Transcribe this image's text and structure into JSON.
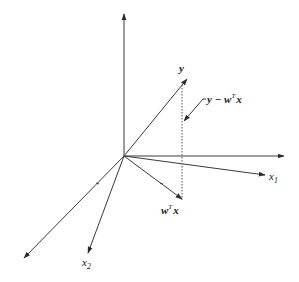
{
  "diagram": {
    "labels": {
      "y": "y",
      "residual_main": "y − w",
      "residual_sup": "T",
      "residual_tail": "x",
      "proj_main": "w",
      "proj_sup": "T",
      "proj_tail": "x",
      "x1_main": "x",
      "x1_sub": "1",
      "x2_main": "x",
      "x2_sub": "2"
    },
    "elements": [
      {
        "id": "vertical-axis",
        "type": "axis"
      },
      {
        "id": "horizontal-axis",
        "type": "axis"
      },
      {
        "id": "x1-axis",
        "type": "axis",
        "label": "x1"
      },
      {
        "id": "x2-axis",
        "type": "axis",
        "label": "x2"
      },
      {
        "id": "lower-left-axis",
        "type": "axis"
      },
      {
        "id": "y-vector",
        "type": "vector",
        "label": "y"
      },
      {
        "id": "projection-vector",
        "type": "vector",
        "label": "w^T x"
      },
      {
        "id": "residual-line",
        "type": "dotted-line",
        "label": "y − w^T x"
      }
    ],
    "colors": {
      "line": "#3a3a3a",
      "text": "#1a1a1a",
      "background": "#ffffff"
    }
  }
}
